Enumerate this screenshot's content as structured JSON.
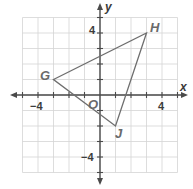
{
  "diagram": {
    "type": "coordinate-plane-triangle",
    "axes": {
      "x_label": "x",
      "y_label": "y",
      "origin_label": "O",
      "x_range": [
        -5,
        5
      ],
      "y_range": [
        -5,
        5
      ],
      "tick_labels": {
        "x_neg": "−4",
        "x_pos": "4",
        "y_pos": "4",
        "y_neg": "−4"
      }
    },
    "triangle": {
      "vertices": [
        {
          "name": "G",
          "x": -3,
          "y": 1
        },
        {
          "name": "H",
          "x": 3,
          "y": 4
        },
        {
          "name": "J",
          "x": 1,
          "y": -2
        }
      ]
    },
    "colors": {
      "grid": "#d4d4d4",
      "axis": "#4a4a4a",
      "triangle": "#6e6e6e",
      "vertex_label": "#6a6a6a"
    }
  }
}
